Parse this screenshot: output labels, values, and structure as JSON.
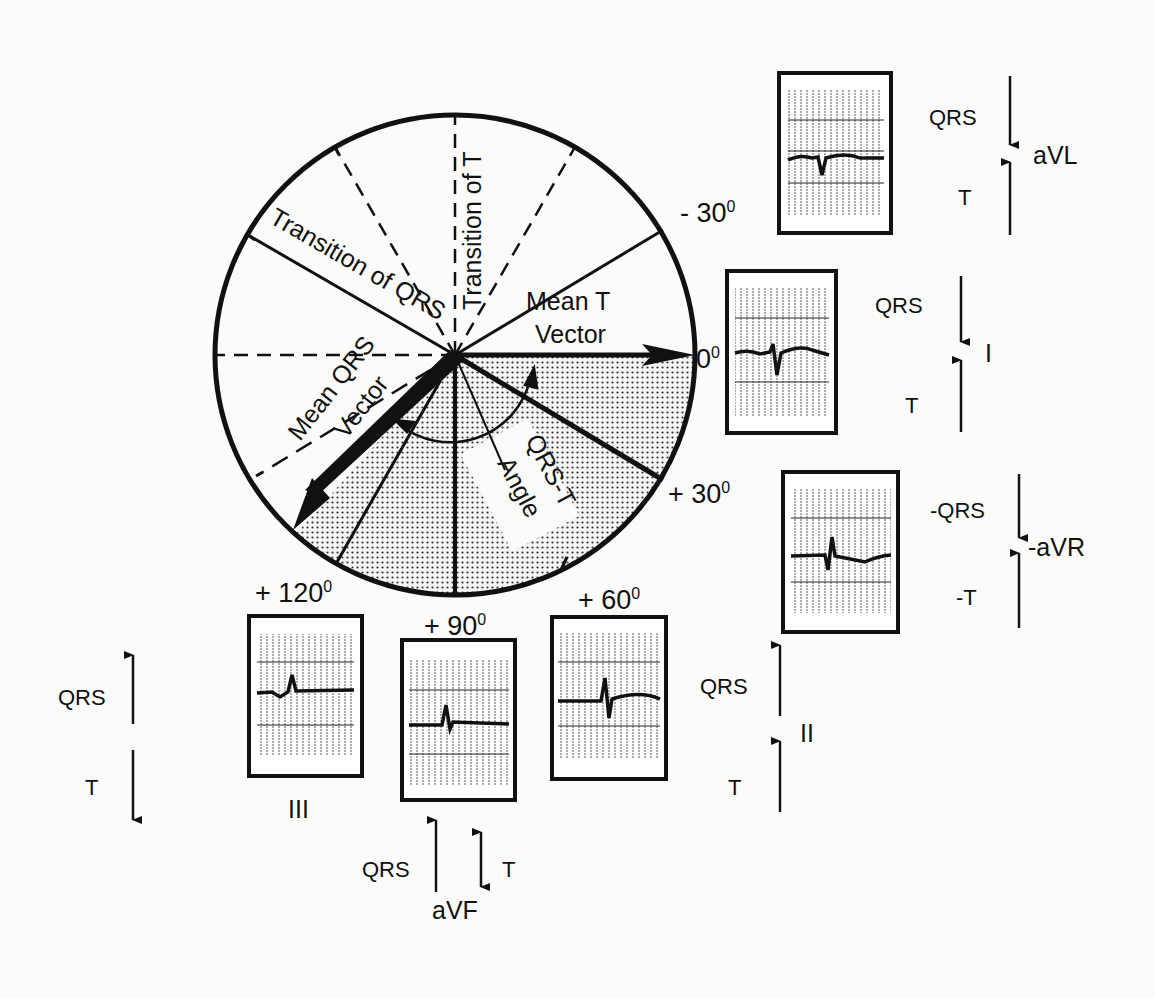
{
  "circle": {
    "labels": {
      "transition_qrs": "Transition of QRS",
      "transition_t": "Transition of T",
      "mean_t_line1": "Mean T",
      "mean_t_line2": "Vector",
      "mean_qrs_line1": "Mean QRS",
      "mean_qrs_line2": "Vector",
      "qrs_t_line1": "QRS-T",
      "qrs_t_line2": "Angle"
    },
    "angles": {
      "minus30": "- 30",
      "zero": "0",
      "plus30": "+ 30",
      "plus60": "+ 60",
      "plus90": "+ 90",
      "plus120": "+ 120",
      "degree": "0"
    }
  },
  "leads": {
    "aVL": {
      "name": "aVL",
      "qrs": "QRS",
      "t": "T",
      "qrs_dir": "down",
      "t_dir": "up"
    },
    "I": {
      "name": "I",
      "qrs": "QRS",
      "t": "T",
      "qrs_dir": "down",
      "t_dir": "up"
    },
    "neg_aVR": {
      "name": "-aVR",
      "qrs": "-QRS",
      "t": "-T",
      "qrs_dir": "down",
      "t_dir": "up"
    },
    "II": {
      "name": "II",
      "qrs": "QRS",
      "t": "T",
      "qrs_dir": "up",
      "t_dir": "up"
    },
    "aVF": {
      "name": "aVF",
      "qrs": "QRS",
      "t": "T",
      "qrs_dir": "up",
      "t_dir": "both"
    },
    "III": {
      "name": "III",
      "qrs": "QRS",
      "t": "T",
      "qrs_dir": "up",
      "t_dir": "down"
    }
  }
}
